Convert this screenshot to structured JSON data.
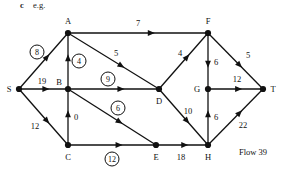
{
  "header": {
    "part_letter": "c",
    "part_text": "e.g."
  },
  "footer": {
    "flow_note": "Flow 39"
  },
  "colors": {
    "ink": "#111111",
    "background": "#ffffff"
  },
  "chart_data": {
    "type": "diagram",
    "title": "c e.g.",
    "annotation": "Flow 39",
    "nodes": [
      {
        "id": "S",
        "label": "S",
        "x": 19,
        "y": 89,
        "label_x": 9,
        "label_y": 89
      },
      {
        "id": "A",
        "label": "A",
        "x": 68,
        "y": 33,
        "label_x": 68,
        "label_y": 21
      },
      {
        "id": "B",
        "label": "B",
        "x": 68,
        "y": 89,
        "label_x": 59,
        "label_y": 82
      },
      {
        "id": "C",
        "label": "C",
        "x": 68,
        "y": 145,
        "label_x": 68,
        "label_y": 157
      },
      {
        "id": "D",
        "label": "D",
        "x": 159,
        "y": 89,
        "label_x": 159,
        "label_y": 101
      },
      {
        "id": "E",
        "label": "E",
        "x": 156,
        "y": 145,
        "label_x": 156,
        "label_y": 157
      },
      {
        "id": "F",
        "label": "F",
        "x": 208,
        "y": 33,
        "label_x": 208,
        "label_y": 21
      },
      {
        "id": "G",
        "label": "G",
        "x": 208,
        "y": 89,
        "label_x": 197,
        "label_y": 89
      },
      {
        "id": "H",
        "label": "H",
        "x": 208,
        "y": 145,
        "label_x": 208,
        "label_y": 157
      },
      {
        "id": "T",
        "label": "T",
        "x": 263,
        "y": 89,
        "label_x": 273,
        "label_y": 89
      }
    ],
    "edges": [
      {
        "from": "S",
        "to": "A",
        "label": "8",
        "circled": true,
        "label_x": 37,
        "label_y": 52
      },
      {
        "from": "S",
        "to": "B",
        "label": "19",
        "circled": false,
        "label_x": 42,
        "label_y": 81
      },
      {
        "from": "S",
        "to": "C",
        "label": "12",
        "circled": false,
        "label_x": 35,
        "label_y": 126
      },
      {
        "from": "A",
        "to": "F",
        "label": "7",
        "circled": false,
        "label_x": 138,
        "label_y": 23
      },
      {
        "from": "A",
        "to": "D",
        "label": "5",
        "circled": false,
        "label_x": 116,
        "label_y": 53
      },
      {
        "from": "B",
        "to": "A",
        "label": "4",
        "circled": true,
        "label_x": 79,
        "label_y": 61
      },
      {
        "from": "B",
        "to": "D",
        "label": "9",
        "circled": true,
        "label_x": 108,
        "label_y": 79
      },
      {
        "from": "B",
        "to": "E",
        "label": "6",
        "circled": true,
        "label_x": 118,
        "label_y": 108
      },
      {
        "from": "C",
        "to": "B",
        "label": "0",
        "circled": false,
        "label_x": 76,
        "label_y": 117
      },
      {
        "from": "C",
        "to": "E",
        "label": "12",
        "circled": true,
        "label_x": 112,
        "label_y": 159
      },
      {
        "from": "D",
        "to": "F",
        "label": "4",
        "circled": false,
        "label_x": 180,
        "label_y": 53
      },
      {
        "from": "D",
        "to": "H",
        "label": "10",
        "circled": false,
        "label_x": 188,
        "label_y": 111
      },
      {
        "from": "E",
        "to": "H",
        "label": "18",
        "circled": false,
        "label_x": 181,
        "label_y": 157
      },
      {
        "from": "F",
        "to": "G",
        "label": "6",
        "circled": false,
        "label_x": 216,
        "label_y": 62
      },
      {
        "from": "F",
        "to": "T",
        "label": "5",
        "circled": false,
        "label_x": 248,
        "label_y": 55
      },
      {
        "from": "G",
        "to": "T",
        "label": "12",
        "circled": false,
        "label_x": 237,
        "label_y": 79
      },
      {
        "from": "H",
        "to": "G",
        "label": "6",
        "circled": false,
        "label_x": 216,
        "label_y": 117
      },
      {
        "from": "H",
        "to": "T",
        "label": "22",
        "circled": false,
        "label_x": 243,
        "label_y": 125
      }
    ]
  }
}
